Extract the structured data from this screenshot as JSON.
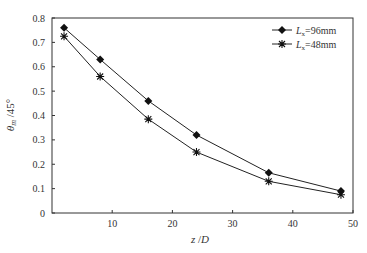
{
  "chart_data": {
    "type": "line",
    "title": "",
    "xlabel": "z/D",
    "ylabel": "θm/45°",
    "xlim": [
      0,
      50
    ],
    "ylim": [
      0,
      0.8
    ],
    "xticks": [
      10,
      20,
      30,
      40,
      50
    ],
    "yticks": [
      0,
      0.1,
      0.2,
      0.3,
      0.4,
      0.5,
      0.6,
      0.7,
      0.8
    ],
    "grid": false,
    "legend_position": "upper right",
    "series": [
      {
        "name": "Lx=96mm",
        "marker": "diamond",
        "x": [
          2,
          8,
          16,
          24,
          36,
          48
        ],
        "values": [
          0.76,
          0.63,
          0.46,
          0.32,
          0.165,
          0.09
        ]
      },
      {
        "name": "Lx=48mm",
        "marker": "asterisk",
        "x": [
          2,
          8,
          16,
          24,
          36,
          48
        ],
        "values": [
          0.725,
          0.56,
          0.385,
          0.25,
          0.13,
          0.075
        ]
      }
    ]
  },
  "labels": {
    "xlabel_main": "z",
    "xlabel_sep": " /",
    "xlabel_D": "D",
    "ylabel_theta": "θ",
    "ylabel_sub": "m",
    "ylabel_rest": " /45°",
    "legend": [
      {
        "L": "L",
        "sub": "x",
        "rest": "=96mm"
      },
      {
        "L": "L",
        "sub": "x",
        "rest": "=48mm"
      }
    ]
  }
}
